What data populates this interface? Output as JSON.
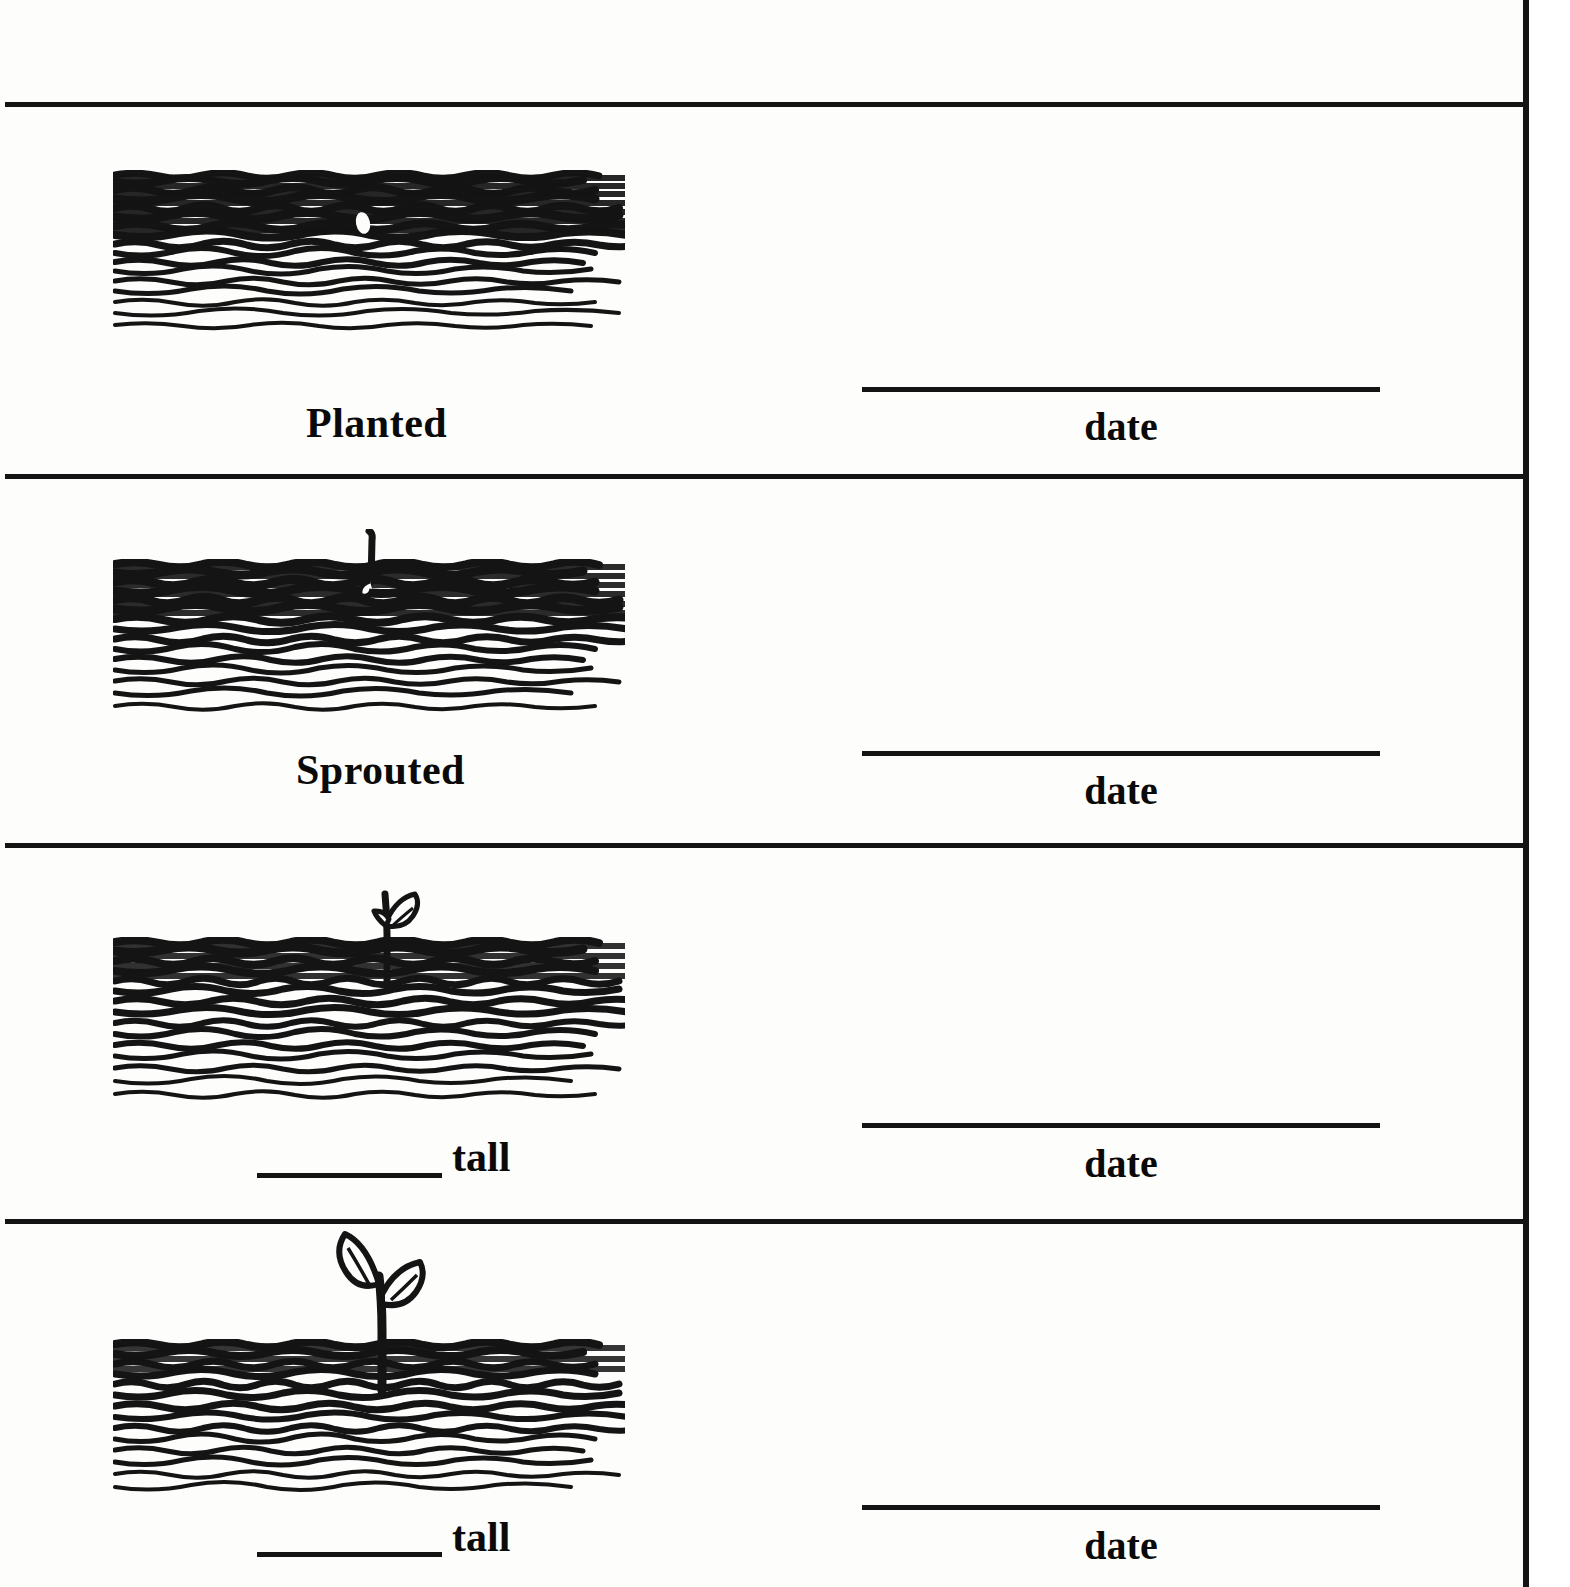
{
  "worksheet": {
    "title": "Plant Growth Record",
    "panel_count": 4
  },
  "panels": [
    {
      "stage_label": "Planted",
      "has_measure_blank": false,
      "measure_suffix": "",
      "date_label": "date",
      "illustration": "seed-in-soil",
      "soil_density": "very-dark",
      "plant_height_desc": "seed below surface"
    },
    {
      "stage_label": "Sprouted",
      "has_measure_blank": false,
      "measure_suffix": "",
      "date_label": "date",
      "illustration": "sprout-in-soil",
      "soil_density": "very-dark",
      "plant_height_desc": "small shoot emerging"
    },
    {
      "stage_label": "",
      "has_measure_blank": true,
      "measure_suffix": "tall",
      "date_label": "date",
      "illustration": "seedling-small",
      "soil_density": "dark",
      "plant_height_desc": "seedling with two small leaves"
    },
    {
      "stage_label": "",
      "has_measure_blank": true,
      "measure_suffix": "tall",
      "date_label": "date",
      "illustration": "seedling-large",
      "soil_density": "medium",
      "plant_height_desc": "seedling with two large leaves"
    }
  ],
  "colors": {
    "ink": "#141414",
    "paper": "#fdfdfc",
    "page_white": "#ffffff"
  }
}
